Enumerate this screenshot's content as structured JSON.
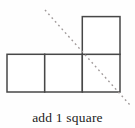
{
  "figure": {
    "caption": "add 1 square",
    "colors": {
      "background": "#fefefe",
      "square_border": "#474747",
      "square_fill": "#ffffff",
      "dashed_line": "#a09a9a",
      "caption_text": "#1c1c1c"
    },
    "diagram": {
      "canvas": {
        "width": 135,
        "height": 110
      },
      "square_size": 37.7,
      "cells": [
        {
          "col": 0,
          "row": 1,
          "x": 7.0,
          "y": 54.3
        },
        {
          "col": 1,
          "row": 1,
          "x": 44.7,
          "y": 54.3
        },
        {
          "col": 2,
          "row": 1,
          "x": 82.3,
          "y": 54.3
        },
        {
          "col": 2,
          "row": 0,
          "x": 82.3,
          "y": 16.6
        }
      ],
      "symmetry_line": {
        "x1": 45,
        "y1": 10,
        "x2": 130,
        "y2": 105,
        "style": "dashed",
        "dash_pattern": "1.8 3.2",
        "stroke_width": 1.4
      },
      "stroke_width": 1.5
    }
  }
}
